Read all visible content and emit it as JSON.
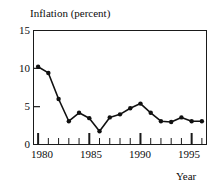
{
  "chart_data": {
    "type": "line",
    "title": "Inflation (percent)",
    "xlabel": "Year",
    "ylabel": "",
    "x": [
      1980,
      1981,
      1982,
      1983,
      1984,
      1985,
      1986,
      1987,
      1988,
      1989,
      1990,
      1991,
      1992,
      1993,
      1994,
      1995,
      1996
    ],
    "values": [
      10.2,
      9.4,
      6.0,
      3.1,
      4.2,
      3.5,
      1.8,
      3.6,
      4.0,
      4.8,
      5.4,
      4.2,
      3.1,
      3.0,
      3.6,
      3.1,
      3.1
    ],
    "series": [
      {
        "name": "Inflation",
        "values": [
          10.2,
          9.4,
          6.0,
          3.1,
          4.2,
          3.5,
          1.8,
          3.6,
          4.0,
          4.8,
          5.4,
          4.2,
          3.1,
          3.0,
          3.6,
          3.1,
          3.1
        ]
      }
    ],
    "xlim": [
      1979.5,
      1996.5
    ],
    "ylim": [
      0,
      15
    ],
    "yticks": [
      0,
      5,
      10,
      15
    ],
    "ytick_labels": [
      "0",
      "5",
      "10",
      "15"
    ],
    "xticks": [
      1980,
      1981,
      1982,
      1983,
      1984,
      1985,
      1986,
      1987,
      1988,
      1989,
      1990,
      1991,
      1992,
      1993,
      1994,
      1995,
      1996
    ],
    "xtick_major": [
      1980,
      1985,
      1990,
      1995
    ],
    "xtick_labels": [
      "1980",
      "1985",
      "1990",
      "1995"
    ],
    "grid": false,
    "legend": false,
    "marker": "filled-circle",
    "line_color": "#111111",
    "marker_color": "#111111",
    "axis_color": "#1a1a1a",
    "background": "#ffffff"
  },
  "axes": {
    "ytick_0": "0",
    "ytick_1": "5",
    "ytick_2": "10",
    "ytick_3": "15",
    "xtick_0": "1980",
    "xtick_1": "1985",
    "xtick_2": "1990",
    "xtick_3": "1995"
  }
}
